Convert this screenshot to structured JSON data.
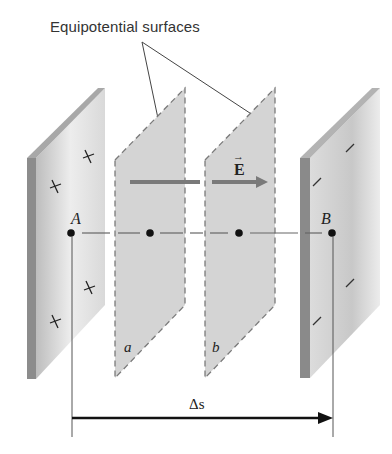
{
  "diagram": {
    "title_label": "Equipotential surfaces",
    "field_label": "E",
    "field_arrow_symbol": "→",
    "points": [
      {
        "name": "A",
        "label": "A",
        "x": 71,
        "y": 233
      },
      {
        "name": "mid-a",
        "label": "",
        "x": 150,
        "y": 233
      },
      {
        "name": "mid-b",
        "label": "",
        "x": 239,
        "y": 233
      },
      {
        "name": "B",
        "label": "B",
        "x": 332,
        "y": 233
      }
    ],
    "surfaces": [
      {
        "name": "left-plate",
        "charge_sign": "+",
        "label": ""
      },
      {
        "name": "surface-a",
        "label": "a"
      },
      {
        "name": "surface-b",
        "label": "b"
      },
      {
        "name": "right-plate",
        "charge_sign": "-",
        "label": ""
      }
    ],
    "displacement_label": "Δs",
    "colors": {
      "plate_front": "#e6e6e6",
      "plate_edge": "#8c8c8c",
      "surface_fill": "#d2d2d2",
      "field_arrow": "#7a7a7a",
      "ink": "#111111"
    }
  }
}
